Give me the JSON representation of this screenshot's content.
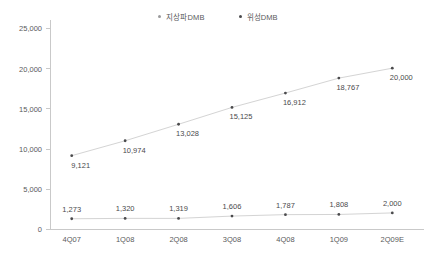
{
  "chart_data": {
    "type": "line",
    "title": "",
    "subtitle": "",
    "xlabel": "",
    "ylabel": "",
    "categories": [
      "4Q07",
      "1Q08",
      "2Q08",
      "3Q08",
      "4Q08",
      "1Q09",
      "2Q09E"
    ],
    "series": [
      {
        "name": "지상파DMB",
        "values": [
          9121,
          10974,
          13028,
          15125,
          16912,
          18767,
          20000
        ],
        "labels": [
          "9,121",
          "10,974",
          "13,028",
          "15,125",
          "16,912",
          "18,767",
          "20,000"
        ],
        "color": "#4a4a4c",
        "line_color": "#d4d4d4"
      },
      {
        "name": "위성DMB",
        "values": [
          1273,
          1320,
          1319,
          1606,
          1787,
          1808,
          2000
        ],
        "labels": [
          "1,273",
          "1,320",
          "1,319",
          "1,606",
          "1,787",
          "1,808",
          "2,000"
        ],
        "color": "#4a4a4c",
        "line_color": "#b9b9b9"
      }
    ],
    "ylim": [
      0,
      25000
    ],
    "yticks": [
      0,
      5000,
      10000,
      15000,
      20000,
      25000
    ],
    "ytick_labels": [
      "0",
      "5,000",
      "10,000",
      "15,000",
      "20,000",
      "25,000"
    ],
    "grid": false,
    "legend_position": "top-center",
    "marker": "dot",
    "data_labels": true
  },
  "legend": {
    "entries": [
      {
        "label": "지상파DMB",
        "color": "#9a9a9c"
      },
      {
        "label": "위성DMB",
        "color": "#4a4a4c"
      }
    ]
  },
  "axes": {
    "y_labels": [
      "25,000",
      "20,000",
      "15,000",
      "10,000",
      "5,000",
      "0"
    ],
    "x_labels": [
      "4Q07",
      "1Q08",
      "2Q08",
      "3Q08",
      "4Q08",
      "1Q09",
      "2Q09E"
    ]
  }
}
